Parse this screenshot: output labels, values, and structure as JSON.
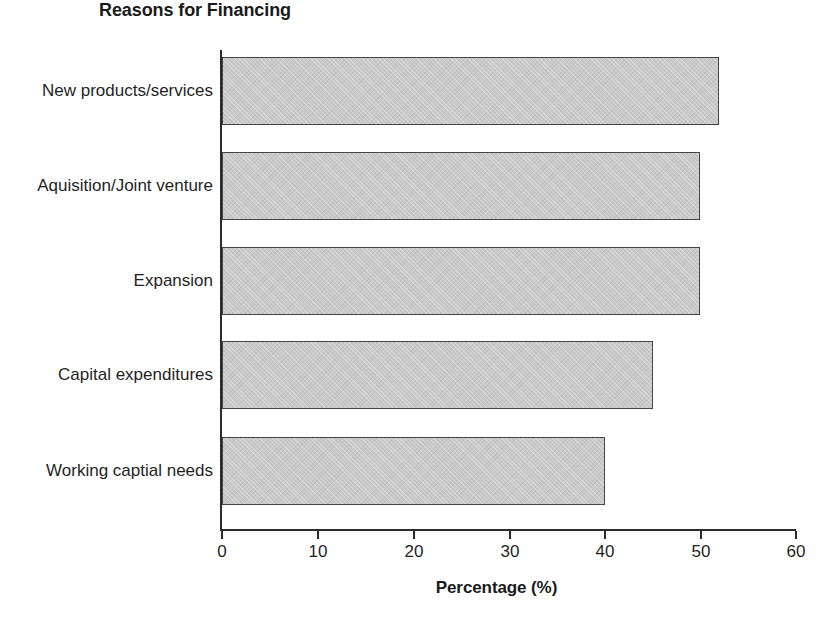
{
  "chart_data": {
    "type": "bar",
    "orientation": "horizontal",
    "title": "Reasons for Financing",
    "xlabel": "Percentage (%)",
    "ylabel": "",
    "xlim": [
      0,
      60
    ],
    "xticks": [
      0,
      10,
      20,
      30,
      40,
      50,
      60
    ],
    "xtick_labels": [
      "0",
      "10",
      "20",
      "30",
      "40",
      "50",
      "60"
    ],
    "grid": false,
    "legend": null,
    "categories": [
      "New products/services",
      "Aquisition/Joint venture",
      "Expansion",
      "Capital expenditures",
      "Working captial needs"
    ],
    "values": [
      52,
      50,
      50,
      45,
      40
    ],
    "series": [
      {
        "name": "Percentage",
        "values": [
          52,
          50,
          50,
          45,
          40
        ]
      }
    ],
    "bar_fill_color": "#c9c9c9",
    "bar_border_color": "#454545",
    "axis_color": "#2b2b2b",
    "text_color": "#1f1f1f",
    "background_color": "#ffffff"
  }
}
